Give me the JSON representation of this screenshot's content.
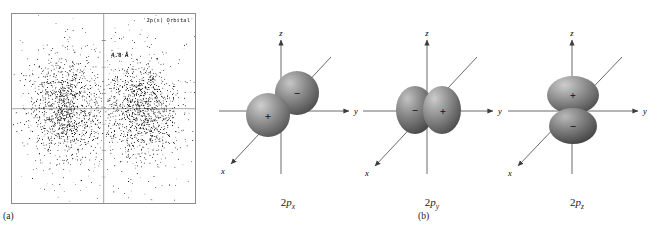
{
  "figure": {
    "panel_a": {
      "caption": "(a)",
      "orbital_label": "2p(x) Orbital",
      "distance_label": "4.8 Å",
      "plot_type": "electron density dot plot",
      "dot_color": "#101010",
      "frame_color": "#8d8d8d",
      "axis_color": "#8d8d8d",
      "n_dots": 2600,
      "lobe_centers": [
        {
          "x": -0.42,
          "y": 0.0
        },
        {
          "x": 0.42,
          "y": 0.0
        }
      ],
      "tick_positions_fraction": [
        0.14,
        0.28,
        0.42,
        0.58,
        0.72,
        0.86
      ],
      "vertical_axis_fraction": 0.5,
      "horizontal_axis_fraction": 0.5
    },
    "panel_b": {
      "caption": "(b)",
      "axis_labels": {
        "x": "x",
        "y": "y",
        "z": "z"
      },
      "sphere_color": "#8a8a8a",
      "sphere_highlight": "#c9c9c9",
      "sphere_shadow": "#4f4f4f",
      "axis_color": "#4a4a4a",
      "orbitals": [
        {
          "id": "2px",
          "label_prefix": "2",
          "label_italic": "p",
          "label_sub": "x",
          "lobe_axis": "x",
          "signs": {
            "positive": "+",
            "negative": "−"
          },
          "positive_lobe_position": "front-left",
          "negative_lobe_position": "back-upper-right"
        },
        {
          "id": "2py",
          "label_prefix": "2",
          "label_italic": "p",
          "label_sub": "y",
          "lobe_axis": "y",
          "signs": {
            "positive": "+",
            "negative": "−"
          },
          "positive_lobe_position": "right",
          "negative_lobe_position": "left"
        },
        {
          "id": "2pz",
          "label_prefix": "2",
          "label_italic": "p",
          "label_sub": "z",
          "lobe_axis": "z",
          "signs": {
            "positive": "+",
            "negative": "−"
          },
          "positive_lobe_position": "top",
          "negative_lobe_position": "bottom"
        }
      ]
    }
  },
  "chart_data": {
    "type": "scatter",
    "title": "2p(x) Orbital",
    "annotations": [
      "4.8 Å"
    ],
    "xlabel": "",
    "ylabel": "",
    "xlim": [
      -1,
      1
    ],
    "ylim": [
      -1,
      1
    ],
    "grid": false,
    "legend": "none",
    "series": [
      {
        "name": "electron density dots",
        "n_points": 2600,
        "lobe_separation_angstrom": 4.8,
        "clusters": [
          {
            "center_x": -0.42,
            "center_y": 0.0,
            "spread_x": 0.2,
            "spread_y": 0.26,
            "weight": 0.5
          },
          {
            "center_x": 0.42,
            "center_y": 0.0,
            "spread_x": 0.2,
            "spread_y": 0.26,
            "weight": 0.5
          }
        ]
      }
    ]
  }
}
